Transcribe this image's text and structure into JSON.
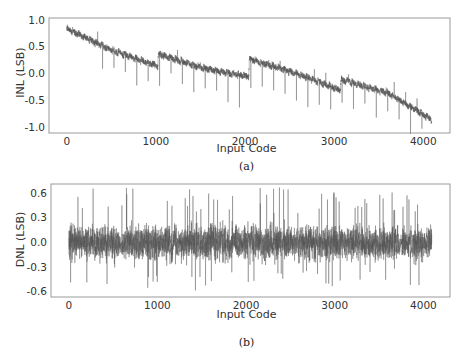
{
  "chart_data": [
    {
      "id": "a",
      "type": "line",
      "title": "",
      "caption": "(a)",
      "xlabel": "Input Code",
      "ylabel": "INL (LSB)",
      "xlim": [
        -200,
        4300
      ],
      "ylim": [
        -1.1,
        1.05
      ],
      "xticks": [
        0,
        1000,
        2000,
        3000,
        4000
      ],
      "xtick_labels": [
        "0",
        "1000",
        "2000",
        "3000",
        "4000"
      ],
      "yticks": [
        1.0,
        0.5,
        0.0,
        -0.5,
        -1.0
      ],
      "ytick_labels": [
        "1.0",
        "0.5",
        "0.0",
        "-0.5",
        "-1.0"
      ],
      "grid": false,
      "legend": null,
      "line_color": "#555555",
      "n_points": 4096,
      "series": [
        {
          "name": "INL",
          "description": "Descending sawtooth trend with segment resets near codes 1024, 2048, 3072; periodic negative spikes",
          "trend_points": [
            {
              "x": 0,
              "y": 0.85
            },
            {
              "x": 500,
              "y": 0.45
            },
            {
              "x": 1020,
              "y": 0.15
            },
            {
              "x": 1030,
              "y": 0.38
            },
            {
              "x": 1500,
              "y": 0.12
            },
            {
              "x": 2040,
              "y": -0.05
            },
            {
              "x": 2050,
              "y": 0.28
            },
            {
              "x": 2600,
              "y": 0.0
            },
            {
              "x": 3070,
              "y": -0.3
            },
            {
              "x": 3080,
              "y": -0.1
            },
            {
              "x": 3600,
              "y": -0.35
            },
            {
              "x": 4095,
              "y": -0.85
            }
          ],
          "noise_amplitude": 0.07,
          "spike_interval": 128,
          "spike_depth": -0.55
        }
      ]
    },
    {
      "id": "b",
      "type": "line",
      "title": "",
      "caption": "(b)",
      "xlabel": "Input Code",
      "ylabel": "DNL (LSB)",
      "xlim": [
        -200,
        4300
      ],
      "ylim": [
        -0.66,
        0.72
      ],
      "xticks": [
        0,
        1000,
        2000,
        3000,
        4000
      ],
      "xtick_labels": [
        "0",
        "1000",
        "2000",
        "3000",
        "4000"
      ],
      "yticks": [
        0.6,
        0.3,
        0.0,
        -0.3,
        -0.6
      ],
      "ytick_labels": [
        "0.6",
        "0.3",
        "0.0",
        "-0.3",
        "-0.6"
      ],
      "grid": false,
      "legend": null,
      "line_color": "#555555",
      "n_points": 4096,
      "series": [
        {
          "name": "DNL",
          "description": "Noise centered at 0 (about ±0.2 LSB) with occasional spikes up to about +0.68 and down to about -0.58",
          "mean": 0.0,
          "noise_amplitude": 0.2,
          "max": 0.68,
          "min": -0.58
        }
      ]
    }
  ]
}
